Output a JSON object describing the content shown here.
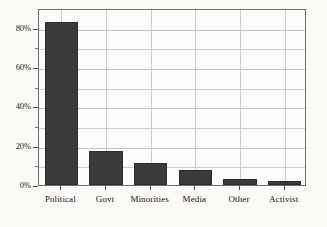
{
  "chart_data": {
    "type": "bar",
    "title": "",
    "subtitle": "",
    "xlabel": "",
    "ylabel": "",
    "categories": [
      "Political",
      "Govt",
      "Minorities",
      "Media",
      "Other",
      "Activist"
    ],
    "values": [
      83,
      17.5,
      11,
      7.5,
      3,
      2
    ],
    "value_suffix": "%",
    "ylim": [
      0,
      90
    ],
    "y_major_ticks": [
      0,
      20,
      40,
      60,
      80
    ],
    "y_major_tick_labels": [
      "0%",
      "20%",
      "40%",
      "60%",
      "80%"
    ],
    "y_minor_ticks": [
      10,
      30,
      50,
      70
    ],
    "grid": true,
    "grid_axis": "both",
    "legend": false,
    "legend_position": "none",
    "series": [
      {
        "name": "share",
        "values": [
          83,
          17.5,
          11,
          7.5,
          3,
          2
        ]
      }
    ],
    "colors": {
      "bar_fill": "#3a3a3a",
      "bar_edge": "#2c2c2c",
      "grid": "#cfcdc9",
      "frame": "#6d6d6d",
      "plot_background": "#fdfcfb",
      "figure_background": "#fbfaf7",
      "tick_label": "#1d1d1d"
    }
  }
}
